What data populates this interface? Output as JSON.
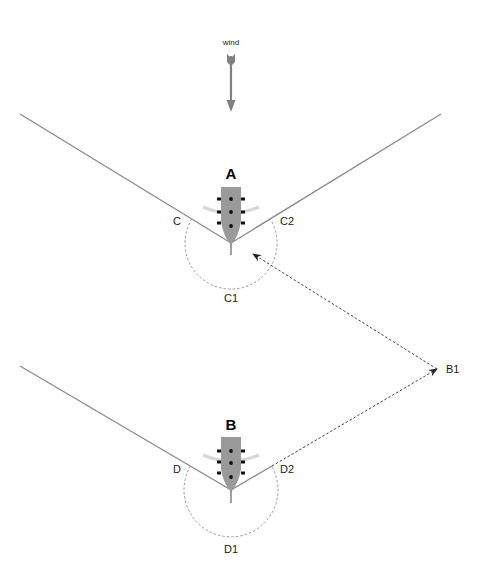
{
  "diagram": {
    "type": "sailing-ship tacking diagram",
    "wind": {
      "label": "wind",
      "direction": "down",
      "color": "#808080"
    },
    "ships": [
      {
        "id": "A",
        "label": "A",
        "arc_labels": {
          "left": "C",
          "bottom": "C1",
          "right": "C2"
        }
      },
      {
        "id": "B",
        "label": "B",
        "arc_labels": {
          "left": "D",
          "bottom": "D1",
          "right": "D2"
        }
      }
    ],
    "waypoint": {
      "label": "B1"
    },
    "colors": {
      "line": "#8a8a8a",
      "hull": "#9a9a9a",
      "dashed": "#444444",
      "arc": "#9a9a9a",
      "sail": "#d9d9d9"
    }
  }
}
